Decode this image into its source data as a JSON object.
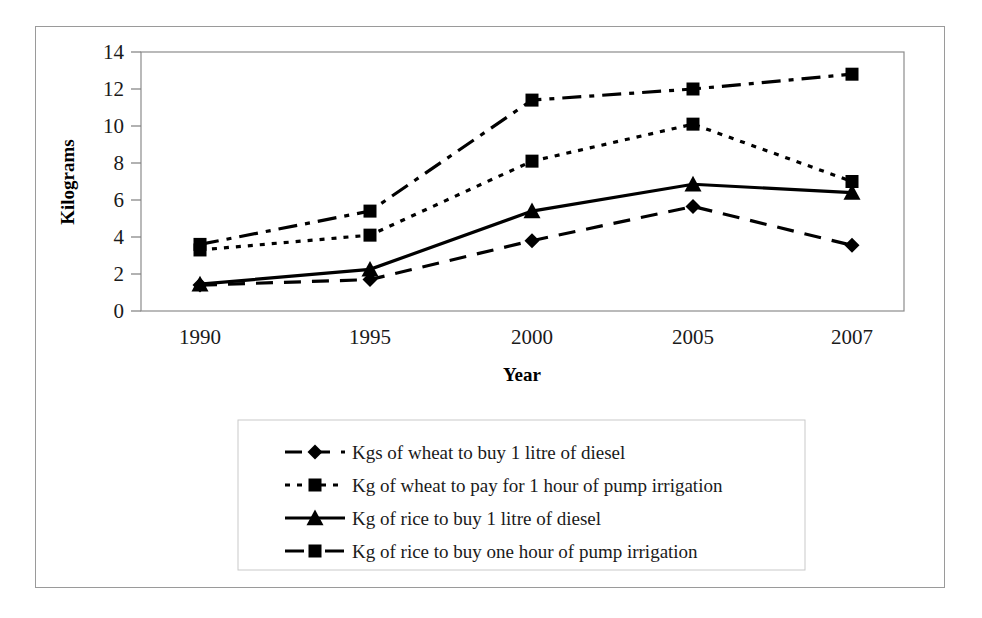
{
  "chart_data": {
    "type": "line",
    "title": "",
    "xlabel": "Year",
    "ylabel": "Kilograms",
    "categories": [
      "1990",
      "1995",
      "2000",
      "2005",
      "2007"
    ],
    "x": [
      1990,
      1995,
      2000,
      2005,
      2007
    ],
    "ylim": [
      0,
      14
    ],
    "yticks": [
      0,
      2,
      4,
      6,
      8,
      10,
      12,
      14
    ],
    "ytick_labels": [
      "0",
      "2",
      "4",
      "6",
      "8",
      "10",
      "12",
      "14"
    ],
    "grid": false,
    "legend_position": "bottom",
    "series": [
      {
        "name": "Kgs of wheat to buy 1 litre of diesel",
        "marker": "diamond",
        "dash": "long-dash",
        "values": [
          1.4,
          1.7,
          3.8,
          5.65,
          3.55
        ]
      },
      {
        "name": "Kg of wheat to pay for 1 hour of pump irrigation",
        "marker": "square",
        "dash": "dotted",
        "values": [
          3.3,
          4.1,
          8.1,
          10.1,
          7.0
        ]
      },
      {
        "name": "Kg of rice to buy 1 litre of diesel",
        "marker": "triangle",
        "dash": "solid",
        "values": [
          1.45,
          2.25,
          5.4,
          6.85,
          6.4
        ]
      },
      {
        "name": "Kg of rice to buy one hour of pump irrigation",
        "marker": "square",
        "dash": "dash-dot",
        "values": [
          3.6,
          5.4,
          11.4,
          12.0,
          12.8
        ]
      }
    ]
  },
  "colors": {
    "series_line": "#000000",
    "axis": "#7f7f7f",
    "frame": "#9a9a9a",
    "text": "#1a1a1a"
  }
}
